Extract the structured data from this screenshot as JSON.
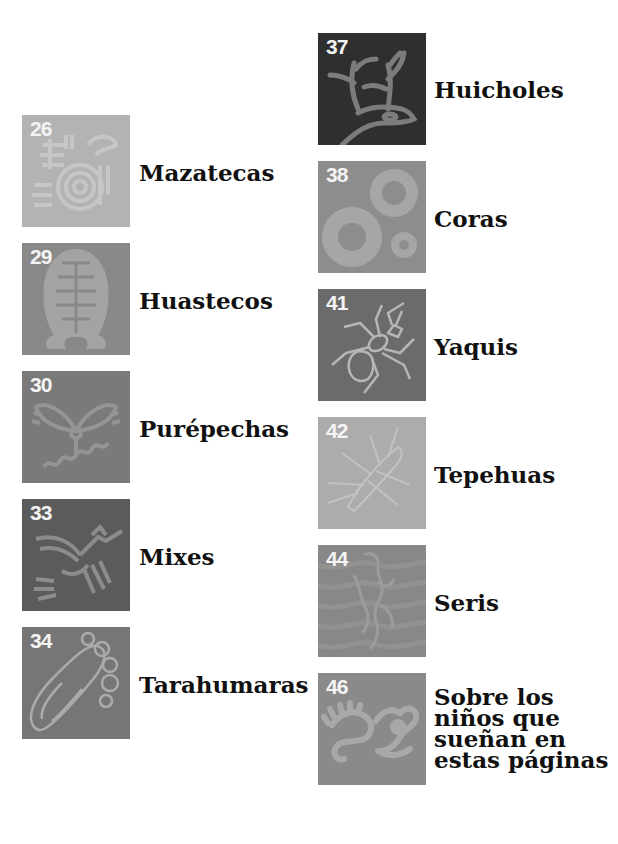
{
  "entries": [
    {
      "page": "26",
      "title": "Mazatecas",
      "icon": "bird-spiral-glyph",
      "bg": "#b3b3b3",
      "fg": "#c6c6c6"
    },
    {
      "page": "29",
      "title": "Huastecos",
      "icon": "idol-figure-glyph",
      "bg": "#898989",
      "fg": "#a3a3a3"
    },
    {
      "page": "30",
      "title": "Purépechas",
      "icon": "winged-creature-glyph",
      "bg": "#7a7a7a",
      "fg": "#959595"
    },
    {
      "page": "33",
      "title": "Mixes",
      "icon": "hummingbird-glyph",
      "bg": "#5b5b5b",
      "fg": "#8c8c8c"
    },
    {
      "page": "34",
      "title": "Tarahumaras",
      "icon": "footprint-glyph",
      "bg": "#767676",
      "fg": "#ababab"
    },
    {
      "page": "37",
      "title": "Huicholes",
      "icon": "deer-glyph",
      "bg": "#2f2f2f",
      "fg": "#7c7c7c"
    },
    {
      "page": "38",
      "title": "Coras",
      "icon": "circles-glyph",
      "bg": "#8d8d8d",
      "fg": "#a6a6a6"
    },
    {
      "page": "41",
      "title": "Yaquis",
      "icon": "ant-glyph",
      "bg": "#6b6b6b",
      "fg": "#b6b6b6"
    },
    {
      "page": "42",
      "title": "Tepehuas",
      "icon": "insect-glyph",
      "bg": "#acacac",
      "fg": "#c2c2c2"
    },
    {
      "page": "44",
      "title": "Seris",
      "icon": "figure-glyph",
      "bg": "#888888",
      "fg": "#9c9c9c"
    },
    {
      "page": "46",
      "title": "Sobre los\nniños que\nsueñan en\nestas páginas",
      "icon": "serpent-glyph",
      "bg": "#8a8a8a",
      "fg": "#a8a8a8"
    }
  ]
}
